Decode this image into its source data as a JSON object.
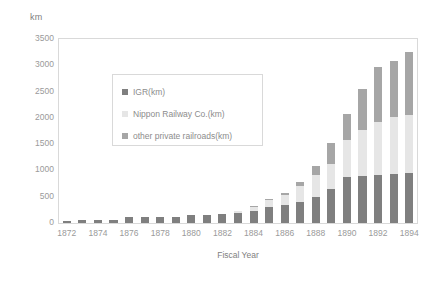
{
  "chart_data": {
    "type": "bar",
    "title": "",
    "subtitle": "",
    "stacked": true,
    "xlabel": "Fiscal Year",
    "ylabel": "km",
    "ylim": [
      0,
      3500
    ],
    "ytick_step": 500,
    "grid": false,
    "legend_position": "inside-upper-left",
    "categories": [
      "1872",
      "1873",
      "1874",
      "1875",
      "1876",
      "1877",
      "1878",
      "1879",
      "1880",
      "1881",
      "1882",
      "1883",
      "1884",
      "1885",
      "1886",
      "1887",
      "1888",
      "1889",
      "1890",
      "1891",
      "1892",
      "1893",
      "1894"
    ],
    "xtick_labels": [
      "1872",
      "1874",
      "1876",
      "1878",
      "1880",
      "1882",
      "1884",
      "1886",
      "1888",
      "1890",
      "1892",
      "1894"
    ],
    "ytick_labels": [
      "0",
      "500",
      "1000",
      "1500",
      "2000",
      "2500",
      "3000",
      "3500"
    ],
    "series": [
      {
        "name": "IGR(km)",
        "color": "#7f7f7f",
        "values": [
          29,
          60,
          60,
          66,
          105,
          106,
          106,
          121,
          159,
          159,
          176,
          190,
          228,
          300,
          350,
          400,
          500,
          640,
          870,
          900,
          910,
          940,
          950
        ]
      },
      {
        "name": "Nippon Railway Co.(km)",
        "color": "#e6e6e6",
        "values": [
          0,
          0,
          0,
          0,
          0,
          0,
          0,
          0,
          0,
          0,
          0,
          30,
          80,
          130,
          180,
          300,
          420,
          480,
          700,
          860,
          1020,
          1070,
          1100
        ]
      },
      {
        "name": "other private railroads(km)",
        "color": "#a6a6a6",
        "values": [
          0,
          0,
          0,
          0,
          0,
          0,
          0,
          0,
          0,
          0,
          0,
          0,
          10,
          20,
          40,
          80,
          160,
          400,
          500,
          780,
          1030,
          1080,
          1200
        ]
      }
    ],
    "totals": [
      29,
      60,
      60,
      66,
      105,
      106,
      106,
      121,
      159,
      159,
      176,
      220,
      318,
      450,
      570,
      780,
      1080,
      1520,
      2070,
      2540,
      2960,
      3090,
      3250
    ]
  }
}
